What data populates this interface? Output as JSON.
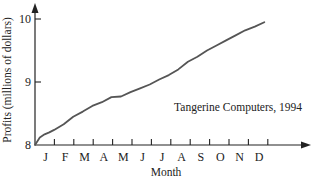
{
  "chart_data": {
    "type": "line",
    "title": "",
    "annotation": "Tangerine Computers, 1994",
    "xlabel": "Month",
    "ylabel": "Profits (millions of dollars)",
    "categories": [
      "J",
      "F",
      "M",
      "A",
      "M",
      "J",
      "J",
      "A",
      "S",
      "O",
      "N",
      "D"
    ],
    "y_ticks": [
      "8",
      "9",
      "10"
    ],
    "ylim": [
      8,
      10
    ],
    "grid": false,
    "legend": "none",
    "series": [
      {
        "name": "Tangerine Computers, 1994",
        "x": [
          0,
          0.25,
          0.5,
          0.75,
          1,
          1.5,
          2,
          2.5,
          3,
          3.5,
          4,
          4.5,
          5,
          5.5,
          6,
          6.5,
          7,
          7.5,
          8,
          8.5,
          9,
          9.5,
          10,
          10.5,
          11,
          11.5,
          12
        ],
        "values": [
          8.0,
          8.12,
          8.17,
          8.2,
          8.24,
          8.33,
          8.45,
          8.53,
          8.62,
          8.68,
          8.76,
          8.77,
          8.84,
          8.9,
          8.96,
          9.04,
          9.11,
          9.2,
          9.32,
          9.4,
          9.5,
          9.58,
          9.66,
          9.74,
          9.82,
          9.88,
          9.95
        ]
      }
    ],
    "color": "#555555"
  }
}
